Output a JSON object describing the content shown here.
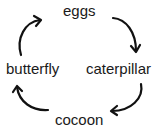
{
  "diagram": {
    "type": "cycle",
    "title": "",
    "stages": [
      {
        "id": "eggs",
        "label": "eggs",
        "position": "top"
      },
      {
        "id": "caterpillar",
        "label": "caterpillar",
        "position": "right"
      },
      {
        "id": "cocoon",
        "label": "cocoon",
        "position": "bottom"
      },
      {
        "id": "butterfly",
        "label": "butterfly",
        "position": "left"
      }
    ],
    "arrows": [
      {
        "from": "eggs",
        "to": "caterpillar",
        "direction": "clockwise"
      },
      {
        "from": "caterpillar",
        "to": "cocoon",
        "direction": "clockwise"
      },
      {
        "from": "cocoon",
        "to": "butterfly",
        "direction": "clockwise"
      },
      {
        "from": "butterfly",
        "to": "eggs",
        "direction": "clockwise"
      }
    ],
    "colors": {
      "text": "#1a1a1a",
      "arrow": "#111111",
      "background": "#ffffff"
    }
  }
}
